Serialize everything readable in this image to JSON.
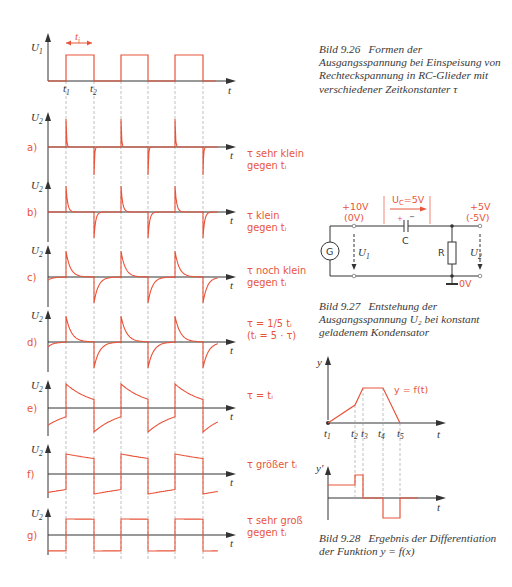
{
  "figure_9_26": {
    "caption_number": "Bild 9.26",
    "caption_text": "Formen der Ausgangsspannung bei Einspeisung von Rechteckspannung in RC-Glieder mit verschiedener Zeitkonstanter τ",
    "input_plot": {
      "y_label": "U",
      "y_sub": "1",
      "x_label": "t",
      "pulse_width_label": "t",
      "pulse_width_sub": "i",
      "t1_label": "t",
      "t1_sub": "1",
      "t2_label": "t",
      "t2_sub": "2"
    },
    "output_plots": [
      {
        "id": "a",
        "label": "a)",
        "y_label": "U",
        "y_sub": "2",
        "x_label": "t",
        "condition_line1": "τ sehr klein",
        "condition_line2": "gegen tᵢ",
        "tau_ratio": 0.02
      },
      {
        "id": "b",
        "label": "b)",
        "y_label": "U",
        "y_sub": "2",
        "x_label": "t",
        "condition_line1": "τ klein",
        "condition_line2": "gegen tᵢ",
        "tau_ratio": 0.06
      },
      {
        "id": "c",
        "label": "c)",
        "y_label": "U",
        "y_sub": "2",
        "x_label": "t",
        "condition_line1": "τ noch klein",
        "condition_line2": "gegen tᵢ",
        "tau_ratio": 0.16
      },
      {
        "id": "d",
        "label": "d)",
        "y_label": "U",
        "y_sub": "2",
        "x_label": "t",
        "condition_line1": "τ = 1/5 tᵢ",
        "condition_line2": "(tᵢ = 5 · τ)",
        "tau_ratio": 0.2
      },
      {
        "id": "e",
        "label": "e)",
        "y_label": "U",
        "y_sub": "2",
        "x_label": "t",
        "condition_line1": "τ = tᵢ",
        "condition_line2": "",
        "tau_ratio": 1
      },
      {
        "id": "f",
        "label": "f)",
        "y_label": "U",
        "y_sub": "2",
        "x_label": "t",
        "condition_line1": "τ größer tᵢ",
        "condition_line2": "",
        "tau_ratio": 4
      },
      {
        "id": "g",
        "label": "g)",
        "y_label": "U",
        "y_sub": "2",
        "x_label": "t",
        "condition_line1": "τ sehr groß",
        "condition_line2": "gegen tᵢ",
        "tau_ratio": 100
      }
    ]
  },
  "figure_9_27": {
    "caption_number": "Bild 9.27",
    "caption_text": "Entstehung der Ausgangsspannung U₂ bei konstant geladenem Kondensator",
    "uc_label": "U",
    "uc_sub": "C",
    "uc_value": "=5V",
    "input_voltage_high": "+10V",
    "input_voltage_low": "(0V)",
    "output_voltage_high": "+5V",
    "output_voltage_low": "(-5V)",
    "ground_label": "0V",
    "generator_label": "G",
    "capacitor_label": "C",
    "resistor_label": "R",
    "u1_label": "U",
    "u1_sub": "1",
    "u2_label": "U",
    "u2_sub": "2",
    "plus_sign": "+",
    "minus_sign": "−"
  },
  "figure_9_28": {
    "caption_number": "Bild 9.28",
    "caption_text": "Ergebnis der Differentiation der Funktion y = f(x)",
    "function_label": "y = f(t)",
    "y_label": "y",
    "dy_label": "y'",
    "x_label": "t",
    "t_labels": [
      {
        "label": "t",
        "sub": "1"
      },
      {
        "label": "t",
        "sub": "2"
      },
      {
        "label": "t",
        "sub": "3"
      },
      {
        "label": "t",
        "sub": "4"
      },
      {
        "label": "t",
        "sub": "5"
      }
    ]
  },
  "colors": {
    "signal": "#e8543a",
    "axis": "#333333",
    "guide": "#999999",
    "caption": "#3a3a3a"
  }
}
